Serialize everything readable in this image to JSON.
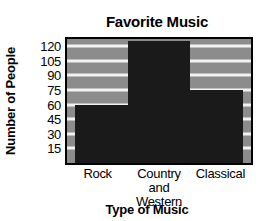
{
  "chart_data": {
    "type": "bar",
    "title": "Favorite Music",
    "xlabel": "Type of Music",
    "ylabel": "Number of People",
    "categories": [
      "Rock",
      "Country\nand\nWestern",
      "Classical"
    ],
    "values": [
      60,
      125,
      75
    ],
    "ylim": [
      0,
      127.5
    ],
    "yticks": [
      120,
      105,
      90,
      75,
      60,
      45,
      30,
      15
    ],
    "grid": true,
    "legend": false,
    "colors": {
      "plot_background": "#8c8c8c",
      "bar_fill": "#1a1a1a",
      "gridline": "#f2f2f2",
      "axis_border": "#000000",
      "text": "#000000",
      "figure_background": "#ffffff"
    }
  }
}
